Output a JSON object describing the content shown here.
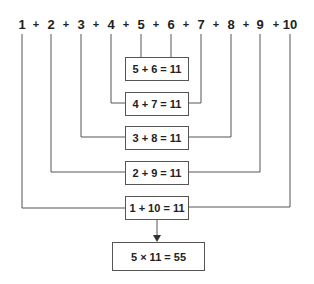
{
  "numbers": [
    "1",
    "2",
    "3",
    "4",
    "5",
    "6",
    "7",
    "8",
    "9",
    "10"
  ],
  "plus_sign": "+",
  "pairs": [
    {
      "label": "5 + 6 = 11",
      "left": "5",
      "right": "6"
    },
    {
      "label": "4 + 7 = 11",
      "left": "4",
      "right": "7"
    },
    {
      "label": "3 + 8 = 11",
      "left": "3",
      "right": "8"
    },
    {
      "label": "2 + 9 = 11",
      "left": "2",
      "right": "9"
    },
    {
      "label": "1 + 10 = 11",
      "left": "1",
      "right": "10"
    }
  ],
  "result": "5 × 11 = 55",
  "colors": {
    "line": "#555555",
    "text": "#222222"
  }
}
